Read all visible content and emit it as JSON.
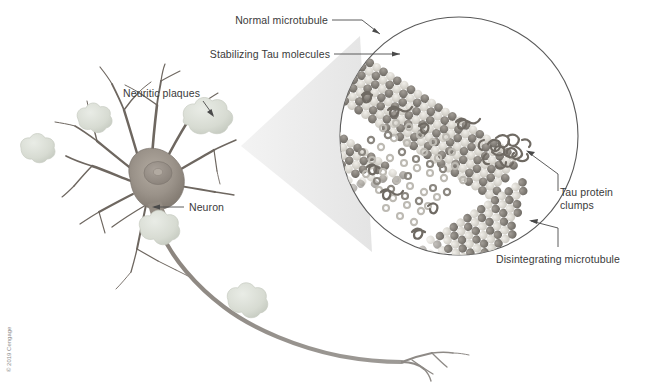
{
  "figure": {
    "background": "#ffffff",
    "width": 647,
    "height": 385
  },
  "labels": {
    "normal_microtubule": "Normal microtubule",
    "stabilizing_tau": "Stabilizing Tau molecules",
    "neuritic_plaques": "Neuritic plaques",
    "neuron": "Neuron",
    "tau_clumps_line1": "Tau protein",
    "tau_clumps_line2": "clumps",
    "disintegrating_microtubule": "Disintegrating microtubule"
  },
  "credit": {
    "text": "© 2019 Cengage"
  },
  "colors": {
    "label_text": "#3a3a3a",
    "leader_line": "#4a4a4a",
    "neuron_body": "#9b9289",
    "neuron_body_dark": "#7d756c",
    "dendrite": "#6e6760",
    "axon": "#8e8a86",
    "plaque": "#d8dcd2",
    "plaque_edge": "#c3c8bd",
    "cone": "#ececec",
    "circle_stroke": "#5a5a5a",
    "tubulin_dark": "#7e7a74",
    "tubulin_light": "#d6d3cb",
    "tau_squiggle": "#6f6a63",
    "loose_tubulin": "#bdbab3"
  },
  "diagram": {
    "inset_circle": {
      "cx": 459,
      "cy": 136,
      "r": 119
    },
    "magnifier_cone": "apex near neuron body widening to inset circle",
    "microtubules": [
      {
        "name": "normal-microtubule-top",
        "state": "intact"
      },
      {
        "name": "disintegrating-microtubule-left",
        "state": "disintegrating"
      },
      {
        "name": "disintegrating-microtubule-bottom",
        "state": "disintegrating"
      }
    ],
    "tau_clump_position": {
      "x": 506,
      "y": 150
    },
    "plaque_count": 5
  }
}
